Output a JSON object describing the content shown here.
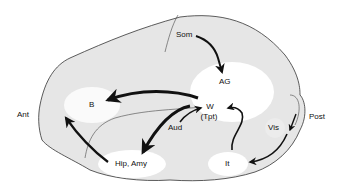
{
  "diagram": {
    "type": "brain-lateral-view-pathways",
    "orientation": {
      "anterior": "Ant",
      "posterior": "Post"
    },
    "regions": [
      {
        "id": "som",
        "label": "Som"
      },
      {
        "id": "ag",
        "label": "AG"
      },
      {
        "id": "b",
        "label": "B"
      },
      {
        "id": "w",
        "label": "W",
        "sublabel": "(Tpt)"
      },
      {
        "id": "aud",
        "label": "Aud"
      },
      {
        "id": "hip",
        "label": "Hip, Amy"
      },
      {
        "id": "vis",
        "label": "Vis"
      },
      {
        "id": "it",
        "label": "It"
      }
    ],
    "arrows": [
      {
        "from": "Som",
        "to": "AG"
      },
      {
        "from": "W",
        "to": "B"
      },
      {
        "from": "W",
        "to": "Hip, Amy"
      },
      {
        "from": "Hip, Amy",
        "to": "B"
      },
      {
        "from": "Aud",
        "to": "W"
      },
      {
        "from": "It",
        "to": "W"
      },
      {
        "from": "Vis",
        "to": "It"
      },
      {
        "from": "Post",
        "to": "Vis"
      }
    ]
  }
}
